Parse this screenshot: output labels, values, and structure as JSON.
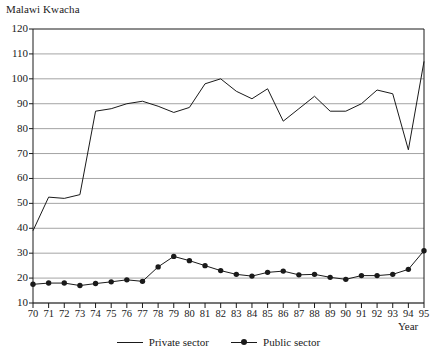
{
  "chart_data": {
    "type": "line",
    "title": "",
    "ylabel": "Malawi Kwacha",
    "xlabel": "Year",
    "ylim": [
      10,
      120
    ],
    "ytick_step": 10,
    "grid": true,
    "legend_position": "bottom-center",
    "categories": [
      "70",
      "71",
      "72",
      "73",
      "74",
      "75",
      "76",
      "77",
      "78",
      "79",
      "80",
      "81",
      "82",
      "83",
      "84",
      "85",
      "86",
      "87",
      "88",
      "89",
      "90",
      "91",
      "92",
      "93",
      "94",
      "95"
    ],
    "x": [
      1970,
      1971,
      1972,
      1973,
      1974,
      1975,
      1976,
      1977,
      1978,
      1979,
      1980,
      1981,
      1982,
      1983,
      1984,
      1985,
      1986,
      1987,
      1988,
      1989,
      1990,
      1991,
      1992,
      1993,
      1994,
      1995
    ],
    "yticks": [
      10,
      20,
      30,
      40,
      50,
      60,
      70,
      80,
      90,
      100,
      110,
      120
    ],
    "series": [
      {
        "name": "Private sector",
        "marker": false,
        "color": "#1a1a1a",
        "values": [
          39,
          52.5,
          52,
          53.5,
          87,
          88,
          90,
          91,
          89,
          86.5,
          88.5,
          98,
          100,
          95,
          92,
          96,
          83,
          88,
          93,
          87,
          87,
          90,
          95.5,
          94,
          71.5,
          107
        ]
      },
      {
        "name": "Public sector",
        "marker": true,
        "color": "#1a1a1a",
        "values": [
          17.5,
          18,
          18,
          17,
          17.8,
          18.5,
          19.3,
          18.7,
          24.5,
          28.7,
          27,
          25,
          23,
          21.5,
          20.8,
          22.3,
          22.8,
          21.3,
          21.5,
          20.3,
          19.5,
          21,
          21,
          21.5,
          23.5,
          31
        ]
      }
    ]
  },
  "legend": {
    "items": [
      {
        "label": "Private sector"
      },
      {
        "label": "Public sector"
      }
    ]
  },
  "colors": {
    "line": "#1a1a1a",
    "grid": "#9a9a9a",
    "axis": "#1a1a1a",
    "background": "#ffffff"
  }
}
